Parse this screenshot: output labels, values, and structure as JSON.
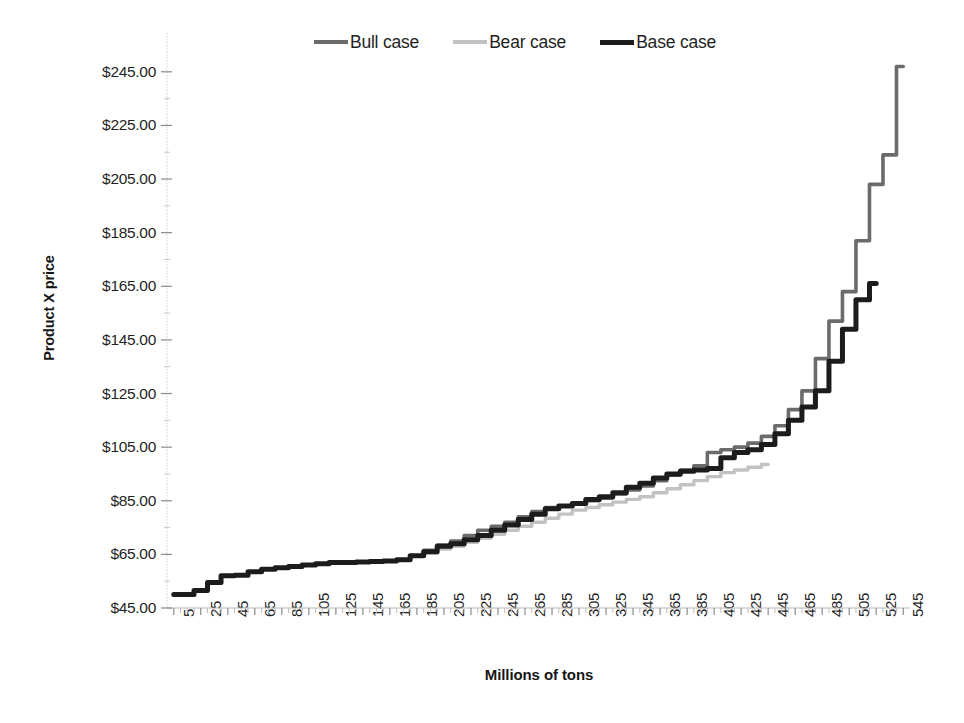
{
  "chart_data": {
    "type": "line",
    "title": "",
    "xlabel": "Millions of tons",
    "ylabel": "Product X price",
    "xlim": [
      0,
      550
    ],
    "ylim": [
      45,
      255
    ],
    "grid": false,
    "legend_position": "top-center",
    "y_tick_labels": [
      "$245.00",
      "$225.00",
      "$205.00",
      "$185.00",
      "$165.00",
      "$145.00",
      "$125.00",
      "$105.00",
      "$85.00",
      "$65.00",
      "$45.00"
    ],
    "y_tick_values": [
      245,
      225,
      205,
      185,
      165,
      145,
      125,
      105,
      85,
      65,
      45
    ],
    "x_tick_labels": [
      "5",
      "25",
      "45",
      "65",
      "85",
      "105",
      "125",
      "145",
      "165",
      "185",
      "205",
      "225",
      "245",
      "265",
      "285",
      "305",
      "325",
      "345",
      "365",
      "385",
      "405",
      "425",
      "445",
      "465",
      "485",
      "505",
      "525",
      "545"
    ],
    "x_tick_values": [
      5,
      25,
      45,
      65,
      85,
      105,
      125,
      145,
      165,
      185,
      205,
      225,
      245,
      265,
      285,
      305,
      325,
      345,
      365,
      385,
      405,
      425,
      445,
      465,
      485,
      505,
      525,
      545
    ],
    "x_minor_step": 5,
    "series": [
      {
        "name": "Bull case",
        "color": "#6b6b6b",
        "width": 3.6,
        "x": [
          5,
          15,
          25,
          35,
          45,
          55,
          65,
          75,
          85,
          95,
          105,
          115,
          125,
          135,
          145,
          155,
          165,
          175,
          185,
          195,
          205,
          215,
          225,
          235,
          245,
          255,
          265,
          275,
          285,
          295,
          305,
          315,
          325,
          335,
          345,
          355,
          365,
          375,
          385,
          395,
          405,
          415,
          425,
          435,
          445,
          455,
          465,
          475,
          485,
          495,
          505,
          515,
          525,
          535,
          545
        ],
        "y": [
          50,
          50,
          51.5,
          54.5,
          57,
          57.2,
          58.5,
          59.5,
          60,
          60.5,
          61,
          61.5,
          62,
          62,
          62.2,
          62.3,
          62.5,
          63,
          64.5,
          66.5,
          68.5,
          70,
          72,
          74,
          75.5,
          77,
          79,
          81,
          82.5,
          83,
          84,
          85,
          86,
          87.5,
          89,
          90.5,
          92.5,
          94.5,
          96.5,
          98,
          103,
          104,
          105,
          106.5,
          109,
          113,
          119,
          126,
          138,
          152,
          163,
          182,
          203,
          214,
          247
        ]
      },
      {
        "name": "Bear case",
        "color": "#c2c2c2",
        "width": 3.4,
        "x": [
          5,
          15,
          25,
          35,
          45,
          55,
          65,
          75,
          85,
          95,
          105,
          115,
          125,
          135,
          145,
          155,
          165,
          175,
          185,
          195,
          205,
          215,
          225,
          235,
          245,
          255,
          265,
          275,
          285,
          295,
          305,
          315,
          325,
          335,
          345,
          355,
          365,
          375,
          385,
          395,
          405,
          415,
          425,
          435,
          445
        ],
        "y": [
          50,
          50,
          51.5,
          54.5,
          57,
          57.2,
          58.5,
          59.5,
          60,
          60.5,
          61,
          61.5,
          62,
          62,
          62.2,
          62.3,
          62.5,
          63,
          64.3,
          65.5,
          67,
          68,
          69.5,
          71,
          72.5,
          74,
          75.5,
          77,
          78.5,
          80,
          81.5,
          82.5,
          83.5,
          84.5,
          85.5,
          86.5,
          88,
          89.5,
          91,
          92.5,
          94,
          95.5,
          96.5,
          97.5,
          98.5
        ]
      },
      {
        "name": "Base case",
        "color": "#1c1c1c",
        "width": 5.0,
        "x": [
          5,
          15,
          25,
          35,
          45,
          55,
          65,
          75,
          85,
          95,
          105,
          115,
          125,
          135,
          145,
          155,
          165,
          175,
          185,
          195,
          205,
          215,
          225,
          235,
          245,
          255,
          265,
          275,
          285,
          295,
          305,
          315,
          325,
          335,
          345,
          355,
          365,
          375,
          385,
          395,
          405,
          415,
          425,
          435,
          445,
          455,
          465,
          475,
          485,
          495,
          505,
          515,
          525
        ],
        "y": [
          50,
          50,
          51.5,
          54.5,
          57,
          57.2,
          58.5,
          59.5,
          60,
          60.5,
          61,
          61.5,
          62,
          62,
          62.2,
          62.3,
          62.5,
          63,
          64.5,
          66,
          68,
          69,
          70.5,
          72,
          74,
          76,
          78,
          80,
          82,
          83,
          84,
          85.5,
          86.5,
          88,
          90,
          91.5,
          93.5,
          95,
          96,
          96.5,
          97,
          101,
          103,
          104,
          106,
          110,
          115,
          120,
          126,
          137,
          149,
          160,
          166
        ]
      }
    ]
  },
  "legend": {
    "items": [
      {
        "label": "Bull case",
        "color": "#6b6b6b",
        "thickness": "4px"
      },
      {
        "label": "Bear case",
        "color": "#c2c2c2",
        "thickness": "4px"
      },
      {
        "label": "Base case",
        "color": "#1c1c1c",
        "thickness": "5px"
      }
    ]
  },
  "axis_titles": {
    "y": "Product X price",
    "x": "Millions of tons"
  }
}
